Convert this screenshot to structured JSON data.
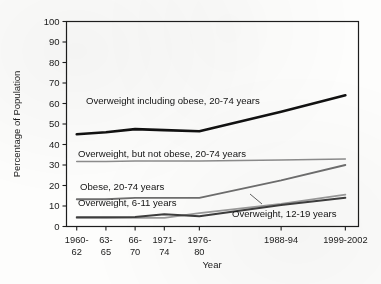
{
  "figure": {
    "background_color": "#fdfdfc",
    "axis_color": "#1d1d1d"
  },
  "chart_data": {
    "type": "line",
    "title": "",
    "xlabel": "Year",
    "ylabel": "Percentage of Population",
    "ylim": [
      0,
      100
    ],
    "ytick_step": 10,
    "grid": false,
    "legend_position": "inline-labels",
    "categories": [
      "1960-62",
      "63-65",
      "66-70",
      "1971-74",
      "1976-80",
      "1988-94",
      "1999-2002"
    ],
    "x_tick_labels_line1": [
      "1960-",
      "63-",
      "66-",
      "1971-",
      "1976-",
      "1988-94",
      "1999-2002"
    ],
    "x_tick_labels_line2": [
      "62",
      "65",
      "70",
      "74",
      "80",
      "",
      ""
    ],
    "ytick_labels": [
      "0",
      "10",
      "20",
      "30",
      "40",
      "50",
      "60",
      "70",
      "80",
      "90",
      "100"
    ],
    "series": [
      {
        "name": "Overweight including obese, 20-74 years",
        "label": "Overweight including obese, 20-74 years",
        "color": "#111111",
        "width": 2.6,
        "values": [
          45.0,
          46.0,
          47.5,
          47.0,
          46.5,
          56.0,
          64.0
        ]
      },
      {
        "name": "Overweight, but not obese, 20-74 years",
        "label": "Overweight, but not obese, 20-74 years",
        "color": "#8c8c8c",
        "width": 1.5,
        "values": [
          31.7,
          31.7,
          32.0,
          32.0,
          32.0,
          32.5,
          32.9
        ]
      },
      {
        "name": "Obese, 20-74 years",
        "label": "Obese, 20-74 years",
        "color": "#6e6e6e",
        "width": 1.8,
        "values": [
          13.3,
          13.3,
          14.0,
          14.0,
          14.0,
          22.5,
          30.0
        ]
      },
      {
        "name": "Overweight, 6-11 years",
        "label": "Overweight, 6-11 years",
        "color": "#9a9a9a",
        "width": 1.8,
        "values": [
          4.2,
          4.2,
          4.2,
          4.2,
          6.5,
          11.0,
          15.5
        ]
      },
      {
        "name": "Overweight, 12-19 years",
        "label": "Overweight, 12-19 years",
        "color": "#3d3d3d",
        "width": 1.9,
        "values": [
          4.5,
          4.5,
          4.6,
          6.0,
          5.0,
          10.5,
          14.0
        ]
      }
    ]
  }
}
